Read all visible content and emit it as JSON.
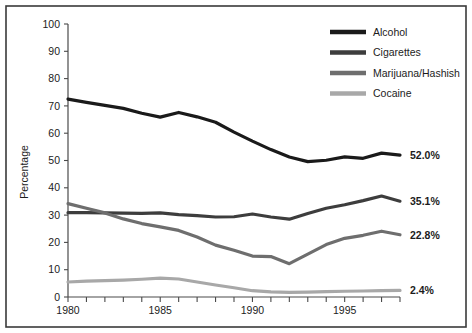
{
  "chart_data": {
    "type": "line",
    "title": "",
    "xlabel": "",
    "ylabel": "Percentage",
    "xlim": [
      1980,
      1998
    ],
    "ylim": [
      0,
      100
    ],
    "grid": false,
    "legend_position": "top-right",
    "x": [
      1980,
      1981,
      1982,
      1983,
      1984,
      1985,
      1986,
      1987,
      1988,
      1989,
      1990,
      1991,
      1992,
      1993,
      1994,
      1995,
      1996,
      1997,
      1998
    ],
    "xticks": [
      1980,
      1981,
      1982,
      1983,
      1984,
      1985,
      1986,
      1987,
      1988,
      1989,
      1990,
      1991,
      1992,
      1993,
      1994,
      1995,
      1996,
      1997,
      1998
    ],
    "xtick_labels": [
      "1980",
      "",
      "",
      "",
      "",
      "1985",
      "",
      "",
      "",
      "",
      "1990",
      "",
      "",
      "",
      "",
      "1995",
      "",
      "",
      ""
    ],
    "yticks": [
      0,
      10,
      20,
      30,
      40,
      50,
      60,
      70,
      80,
      90,
      100
    ],
    "ytick_labels": [
      "0",
      "10",
      "20",
      "30",
      "40",
      "50",
      "60",
      "70",
      "80",
      "90",
      "100"
    ],
    "series": [
      {
        "name": "Alcohol",
        "color": "#1a1a1a",
        "end_label": "52.0%",
        "values": [
          72.5,
          71.3,
          70.2,
          69.1,
          67.3,
          65.9,
          67.6,
          66.0,
          64.0,
          60.4,
          57.1,
          54.0,
          51.3,
          49.6,
          50.1,
          51.3,
          50.8,
          52.7,
          52.0
        ]
      },
      {
        "name": "Cigarettes",
        "color": "#3d3d3d",
        "end_label": "35.1%",
        "values": [
          30.9,
          30.9,
          30.8,
          30.7,
          30.6,
          30.8,
          30.2,
          29.8,
          29.3,
          29.4,
          30.4,
          29.3,
          28.5,
          30.6,
          32.5,
          33.8,
          35.3,
          37.0,
          35.1
        ]
      },
      {
        "name": "Marijuana/Hashish",
        "color": "#6e6e6e",
        "end_label": "22.8%",
        "values": [
          34.2,
          32.5,
          30.8,
          28.6,
          26.9,
          25.7,
          24.4,
          22.0,
          19.0,
          17.1,
          15.0,
          14.8,
          12.2,
          15.7,
          19.2,
          21.5,
          22.6,
          24.1,
          22.8
        ]
      },
      {
        "name": "Cocaine",
        "color": "#a8a8a8",
        "end_label": "2.4%",
        "values": [
          5.5,
          5.8,
          6.0,
          6.2,
          6.5,
          6.9,
          6.6,
          5.5,
          4.4,
          3.4,
          2.3,
          1.9,
          1.7,
          1.8,
          2.0,
          2.1,
          2.2,
          2.3,
          2.4
        ]
      }
    ]
  }
}
